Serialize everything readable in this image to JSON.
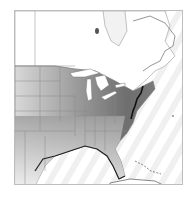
{
  "map": {
    "region": "eastern North America",
    "style": "grayscale density shading with state/province boundaries",
    "colors": {
      "background": "#ffffff",
      "ocean_stripe": "#eeeeee",
      "land_light": "#f4f4f4",
      "density_low": "#cfcfcf",
      "density_mid": "#9a9a9a",
      "density_high": "#6a6a6a",
      "coastline_dense": "#111111",
      "boundary": "#8a8a8a",
      "frame": "#bdbdbd"
    }
  }
}
